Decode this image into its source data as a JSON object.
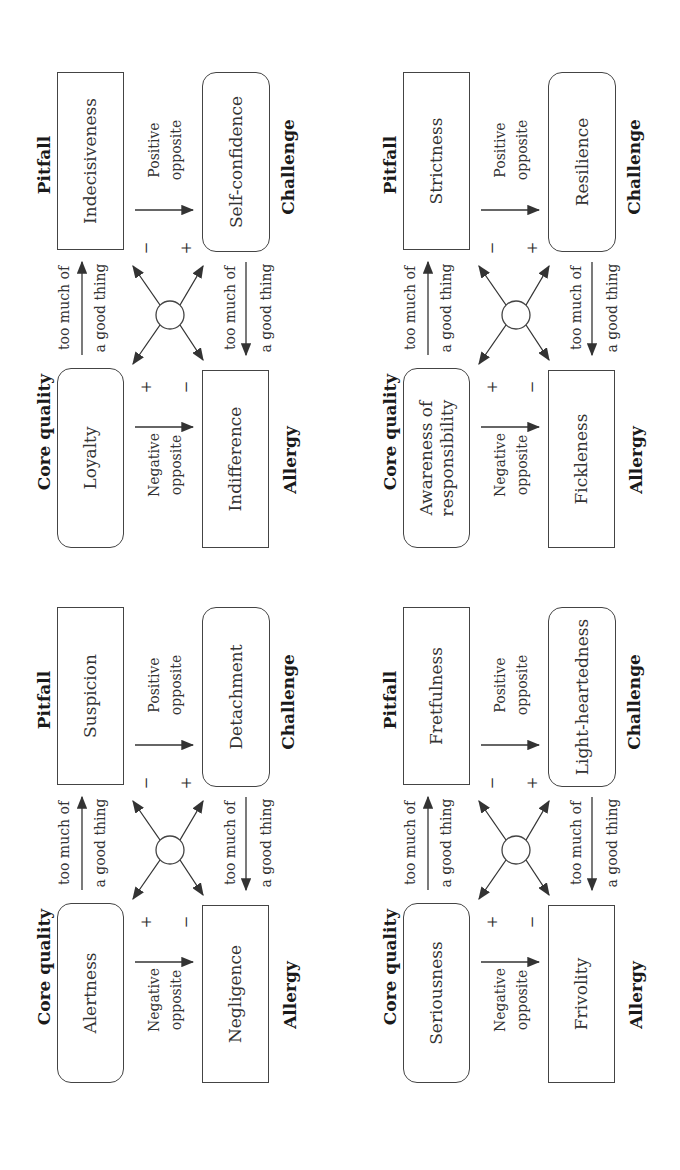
{
  "figure": {
    "orientation": "rotated-90-ccw",
    "diagrams": [
      {
        "id": "loyalty",
        "core_quality": {
          "header": "Core quality",
          "value": "Loyalty"
        },
        "pitfall": {
          "header": "Pitfall",
          "value": "Indecisiveness"
        },
        "allergy": {
          "header": "Allergy",
          "value": "Indifference"
        },
        "challenge": {
          "header": "Challenge",
          "value": "Self-confidence"
        },
        "top_arrow": {
          "line1": "too much of",
          "line2": "a good thing"
        },
        "bottom_arrow": {
          "line1": "too much of",
          "line2": "a good thing"
        },
        "negative_opposite": {
          "line1": "Negative",
          "line2": "opposite"
        },
        "positive_opposite": {
          "line1": "Positive",
          "line2": "opposite"
        },
        "signs": {
          "core": "+",
          "allergy": "−",
          "pitfall": "−",
          "challenge": "+"
        }
      },
      {
        "id": "responsibility",
        "core_quality": {
          "header": "Core quality",
          "value": "Awareness of responsibility"
        },
        "pitfall": {
          "header": "Pitfall",
          "value": "Strictness"
        },
        "allergy": {
          "header": "Allergy",
          "value": "Fickleness"
        },
        "challenge": {
          "header": "Challenge",
          "value": "Resilience"
        },
        "top_arrow": {
          "line1": "too much of",
          "line2": "a good thing"
        },
        "bottom_arrow": {
          "line1": "too much of",
          "line2": "a good thing"
        },
        "negative_opposite": {
          "line1": "Negative",
          "line2": "opposite"
        },
        "positive_opposite": {
          "line1": "Positive",
          "line2": "opposite"
        },
        "signs": {
          "core": "+",
          "allergy": "−",
          "pitfall": "−",
          "challenge": "+"
        }
      },
      {
        "id": "alertness",
        "core_quality": {
          "header": "Core quality",
          "value": "Alertness"
        },
        "pitfall": {
          "header": "Pitfall",
          "value": "Suspicion"
        },
        "allergy": {
          "header": "Allergy",
          "value": "Negligence"
        },
        "challenge": {
          "header": "Challenge",
          "value": "Detachment"
        },
        "top_arrow": {
          "line1": "too much of",
          "line2": "a good thing"
        },
        "bottom_arrow": {
          "line1": "too much of",
          "line2": "a good thing"
        },
        "negative_opposite": {
          "line1": "Negative",
          "line2": "opposite"
        },
        "positive_opposite": {
          "line1": "Positive",
          "line2": "opposite"
        },
        "signs": {
          "core": "+",
          "allergy": "−",
          "pitfall": "−",
          "challenge": "+"
        }
      },
      {
        "id": "seriousness",
        "core_quality": {
          "header": "Core quality",
          "value": "Seriousness"
        },
        "pitfall": {
          "header": "Pitfall",
          "value": "Fretfulness"
        },
        "allergy": {
          "header": "Allergy",
          "value": "Frivolity"
        },
        "challenge": {
          "header": "Challenge",
          "value": "Light-heartedness"
        },
        "top_arrow": {
          "line1": "too much of",
          "line2": "a good thing"
        },
        "bottom_arrow": {
          "line1": "too much of",
          "line2": "a good thing"
        },
        "negative_opposite": {
          "line1": "Negative",
          "line2": "opposite"
        },
        "positive_opposite": {
          "line1": "Positive",
          "line2": "opposite"
        },
        "signs": {
          "core": "+",
          "allergy": "−",
          "pitfall": "−",
          "challenge": "+"
        }
      }
    ]
  },
  "colors": {
    "stroke": "#444444",
    "text": "#2a2a2a",
    "background": "#ffffff"
  }
}
